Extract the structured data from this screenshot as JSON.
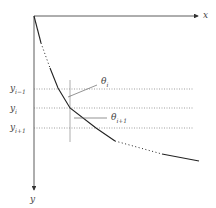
{
  "diagram": {
    "axes": {
      "x_label": "x",
      "y_label": "y"
    },
    "levels": [
      {
        "label": "y",
        "sub": "i−1"
      },
      {
        "label": "y",
        "sub": "i"
      },
      {
        "label": "y",
        "sub": "i+1"
      }
    ],
    "angles": [
      {
        "label": "θ",
        "sub": "i"
      },
      {
        "label": "θ",
        "sub": "i+1"
      }
    ],
    "colors": {
      "axis": "#333333",
      "curve": "#222222",
      "guide": "#999999"
    }
  }
}
